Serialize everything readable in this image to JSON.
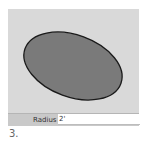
{
  "canvas": {
    "background": "#d9d9d9",
    "shape": {
      "type": "ellipse",
      "fill": "#7a7a7a",
      "stroke": "#1a1a1a"
    }
  },
  "vcb": {
    "label": "Radius",
    "value": "2'"
  },
  "step": {
    "number": "3."
  }
}
